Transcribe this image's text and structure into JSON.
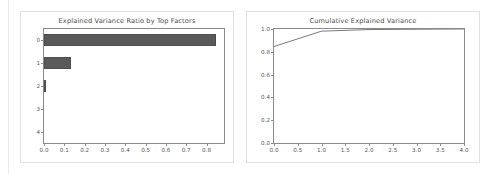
{
  "page": {
    "background": "#ffffff",
    "panel_border_color": "#e0e0e0",
    "axis_color": "#8a8a8a",
    "text_color": "#4a4a4a"
  },
  "charts": {
    "left": {
      "title": "Explained Variance Ratio by Top Factors"
    },
    "right": {
      "title": "Cumulative Explained Variance"
    }
  },
  "chart_data": [
    {
      "type": "bar",
      "orientation": "horizontal",
      "title": "Explained Variance Ratio by Top Factors",
      "xlabel": "",
      "ylabel": "",
      "categories": [
        "0",
        "1",
        "2",
        "3",
        "4"
      ],
      "values": [
        0.846,
        0.135,
        0.006,
        0.0,
        0.0
      ],
      "xlim": [
        0.0,
        0.886
      ],
      "ylim": [
        -0.5,
        4.5
      ],
      "xticks": [
        0.0,
        0.1,
        0.2,
        0.3,
        0.4,
        0.5,
        0.6,
        0.7,
        0.8
      ],
      "xticklabels": [
        "0.0",
        "0.1",
        "0.2",
        "0.3",
        "0.4",
        "0.5",
        "0.6",
        "0.7",
        "0.8"
      ],
      "yticks": [
        0,
        1,
        2,
        3,
        4
      ],
      "yticklabels": [
        "0",
        "1",
        "2",
        "3",
        "4"
      ],
      "bar_color": "#5a5a5a",
      "grid": false,
      "legend": null
    },
    {
      "type": "line",
      "title": "Cumulative Explained Variance",
      "xlabel": "",
      "ylabel": "",
      "x": [
        0,
        1,
        2,
        3,
        4
      ],
      "values": [
        0.846,
        0.981,
        0.995,
        0.998,
        1.0
      ],
      "xlim": [
        0.0,
        4.0
      ],
      "ylim": [
        0.0,
        1.0
      ],
      "xticks": [
        0.0,
        0.5,
        1.0,
        1.5,
        2.0,
        2.5,
        3.0,
        3.5,
        4.0
      ],
      "xticklabels": [
        "0.0",
        "0.5",
        "1.0",
        "1.5",
        "2.0",
        "2.5",
        "3.0",
        "3.5",
        "4.0"
      ],
      "yticks": [
        0.0,
        0.2,
        0.4,
        0.6,
        0.8,
        1.0
      ],
      "yticklabels": [
        "0.0",
        "0.2",
        "0.4",
        "0.6",
        "0.8",
        "1.0"
      ],
      "line_color": "#6b6b6b",
      "grid": false,
      "legend": null
    }
  ]
}
